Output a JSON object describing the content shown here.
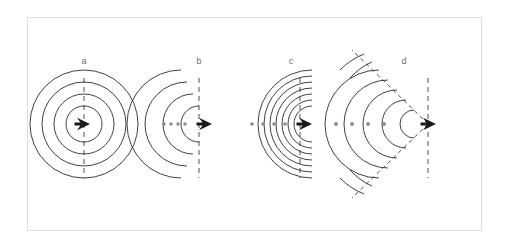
{
  "figure": {
    "background_color": "#ffffff",
    "frame_color": "#dcdcdc",
    "wave_color": "#2b2b2b",
    "dash_color": "#3a3a3a",
    "label_color": "#6e6e6e",
    "craft_color": "#1a1a1a",
    "dot_color": "#8a8a8a"
  },
  "panels": [
    {
      "id": "a",
      "label": "a",
      "label_x": 84,
      "label_y": 64,
      "regime": "stationary-source",
      "description": "Concentric circular wavefronts centered on a stationary source",
      "craft_x": 84,
      "craft_y": 124,
      "axis_x": 84,
      "axis_top": 80,
      "axis_bottom": 176,
      "wavefront_radii": [
        18,
        30,
        42,
        54
      ],
      "wavefront_center_offset": 0,
      "trail_dots": [],
      "mach_lines": []
    },
    {
      "id": "b",
      "label": "b",
      "label_x": 199,
      "label_y": 64,
      "regime": "subsonic-moving",
      "description": "Wavefronts compressed ahead of a subsonic moving source",
      "craft_x": 206,
      "craft_y": 124,
      "axis_x": 199,
      "axis_top": 80,
      "axis_bottom": 176,
      "wavefront_radii": [
        18,
        30,
        42,
        54
      ],
      "wavefront_center_offset": -7,
      "trail_dots": [
        164,
        171,
        178,
        185
      ],
      "mach_lines": []
    },
    {
      "id": "c",
      "label": "c",
      "label_x": 291,
      "label_y": 64,
      "regime": "sonic-mach-1",
      "description": "Wavefronts pile up into a shock wall at the nose at Mach 1",
      "craft_x": 306,
      "craft_y": 124,
      "axis_x": 298,
      "axis_top": 80,
      "axis_bottom": 176,
      "wavefront_radii": [
        18,
        30,
        42,
        54
      ],
      "wavefront_center_offset": -14,
      "trail_dots": [
        252,
        263,
        274,
        285
      ],
      "mach_lines": []
    },
    {
      "id": "d",
      "label": "d",
      "label_x": 404,
      "label_y": 64,
      "regime": "supersonic-mach-cone",
      "description": "Supersonic source outruns its wavefronts forming a Mach cone",
      "craft_x": 427,
      "craft_y": 124,
      "axis_x": 427,
      "axis_top": 80,
      "axis_bottom": 176,
      "wavefront_radii": [
        18,
        30,
        42,
        54
      ],
      "wavefront_center_offset": -30,
      "trail_dots": [
        336,
        352,
        368,
        384
      ],
      "mach_lines": [
        {
          "x1": 427,
          "y1": 124,
          "x2": 355,
          "y2": 52
        },
        {
          "x1": 427,
          "y1": 124,
          "x2": 355,
          "y2": 196
        }
      ]
    }
  ]
}
